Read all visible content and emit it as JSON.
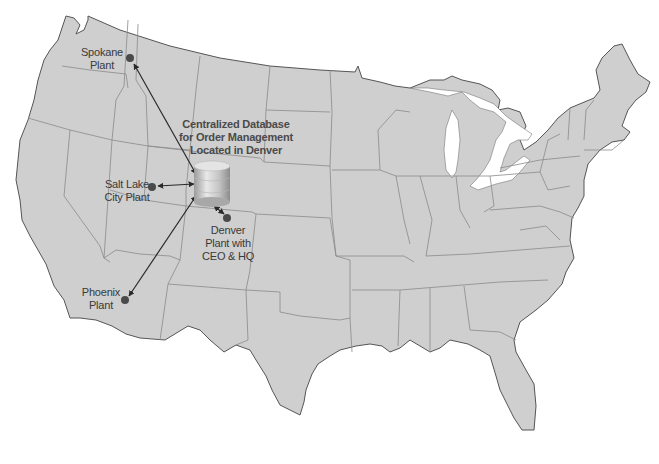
{
  "map": {
    "title": "Centralized Database for Order Management",
    "colors": {
      "land": "#cfcfcf",
      "coast": "#555555",
      "border": "#8a8a8a",
      "water": "#ffffff",
      "marker": "#4a4a4a",
      "arrow": "#2a2a2a"
    }
  },
  "database": {
    "icon": "database-cylinder-icon",
    "label_lines": [
      "Centralized Database",
      "for Order Management",
      "Located in Denver"
    ]
  },
  "plants": [
    {
      "id": "spokane",
      "label_lines": [
        "Spokane",
        "Plant"
      ]
    },
    {
      "id": "salt-lake-city",
      "label_lines": [
        "Salt Lake",
        "City Plant"
      ]
    },
    {
      "id": "denver",
      "label_lines": [
        "Denver",
        "Plant with",
        "CEO & HQ"
      ]
    },
    {
      "id": "phoenix",
      "label_lines": [
        "Phoenix",
        "Plant"
      ]
    }
  ]
}
